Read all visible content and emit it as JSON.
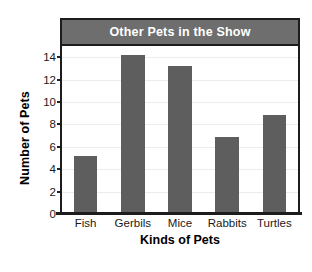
{
  "chart_data": {
    "type": "bar",
    "title": "Other Pets in the Show",
    "xlabel": "Kinds of Pets",
    "ylabel": "Number of Pets",
    "categories": [
      "Fish",
      "Gerbils",
      "Mice",
      "Rabbits",
      "Turtles"
    ],
    "values": [
      5,
      14,
      13,
      6.7,
      8.7
    ],
    "ylim": [
      0,
      15
    ],
    "yticks": [
      0,
      2,
      4,
      6,
      8,
      10,
      12,
      14
    ],
    "ytick_labels": [
      "0",
      "2",
      "4",
      "6",
      "8",
      "10",
      "12",
      "14"
    ],
    "grid": true,
    "legend": false,
    "colors": {
      "bar": "#5e5e5e",
      "banner": "#6e6e6e",
      "banner_text": "#ffffff",
      "frame": "#1c1c1c",
      "gridline": "#ececec",
      "background": "#ffffff",
      "text": "#1a1a1a"
    }
  }
}
